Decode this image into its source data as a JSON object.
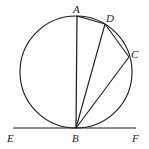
{
  "diagram": {
    "type": "geometry",
    "labels": {
      "A": "A",
      "B": "B",
      "C": "C",
      "D": "D",
      "E": "E",
      "F": "F"
    },
    "circle": {
      "cx": 76,
      "cy": 72,
      "r": 56
    },
    "points": {
      "A": {
        "x": 77,
        "y": 16
      },
      "B": {
        "x": 76,
        "y": 128
      },
      "C": {
        "x": 129,
        "y": 57
      },
      "D": {
        "x": 105,
        "y": 24
      },
      "E": {
        "x": 13,
        "y": 128
      },
      "F": {
        "x": 136,
        "y": 128
      }
    },
    "segments": [
      "AB",
      "BD",
      "BC",
      "AD",
      "DC",
      "EF"
    ],
    "colors": {
      "stroke": "#1a1a1a",
      "background": "#ffffff"
    }
  }
}
